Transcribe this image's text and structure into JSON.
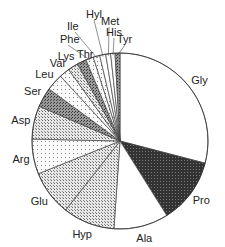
{
  "chart_data": {
    "type": "pie",
    "title": "",
    "start_angle_deg": 0,
    "direction": "clockwise",
    "categories": [
      "Gly",
      "Pro",
      "Ala",
      "Hyp",
      "Glu",
      "Arg",
      "Asp",
      "Ser",
      "Leu",
      "Val",
      "Lys",
      "Thr",
      "Phe",
      "Ile",
      "Hyl",
      "Met",
      "His",
      "Tyr"
    ],
    "values": [
      29.0,
      12.0,
      10.0,
      9.5,
      8.3,
      6.4,
      6.1,
      3.6,
      3.1,
      1.9,
      1.9,
      1.7,
      1.4,
      1.2,
      1.1,
      0.9,
      0.8,
      0.9
    ],
    "units": "percent of residues (estimated)",
    "fills": [
      "white",
      "dense-dark",
      "white",
      "stipple-medium",
      "stipple-medium",
      "stipple-light",
      "stipple-medium",
      "stipple-dark",
      "stipple-light",
      "stipple-light",
      "stipple-medium",
      "stipple-dark",
      "stipple-light",
      "stipple-light",
      "white",
      "white",
      "white",
      "stipple-dark"
    ]
  }
}
